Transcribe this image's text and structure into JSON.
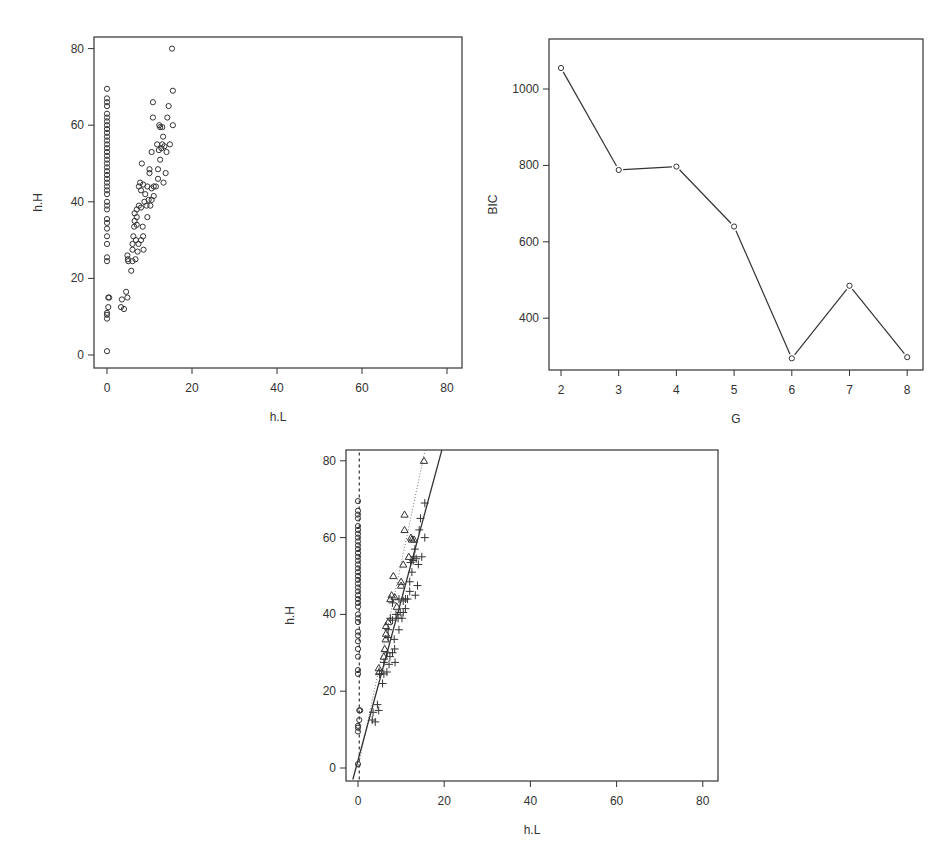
{
  "chart_data": [
    {
      "id": "scatter-raw",
      "type": "scatter",
      "title": "",
      "xlabel": "h.L",
      "ylabel": "h.H",
      "xlim": [
        0,
        80
      ],
      "ylim": [
        0,
        80
      ],
      "xticks": [
        0,
        20,
        40,
        60,
        80
      ],
      "yticks": [
        0,
        20,
        40,
        60,
        80
      ],
      "grid": false,
      "marker": "circle",
      "frame": {
        "left": 94,
        "top": 37,
        "right": 462,
        "bottom": 368
      },
      "map": {
        "x0": 107,
        "xs": 4.25,
        "y0": 355,
        "ys": 3.83
      },
      "points": [
        [
          0,
          1
        ],
        [
          0,
          9.5
        ],
        [
          0,
          10.5
        ],
        [
          0,
          11
        ],
        [
          0.3,
          12.5
        ],
        [
          0.3,
          15
        ],
        [
          0.5,
          15
        ],
        [
          0,
          24.5
        ],
        [
          0,
          25.5
        ],
        [
          0,
          29
        ],
        [
          0,
          31
        ],
        [
          0,
          33
        ],
        [
          0,
          34.5
        ],
        [
          0,
          35.5
        ],
        [
          0,
          38
        ],
        [
          0,
          39
        ],
        [
          0,
          40
        ],
        [
          0,
          42
        ],
        [
          0,
          43
        ],
        [
          0,
          44
        ],
        [
          0,
          45
        ],
        [
          0,
          46
        ],
        [
          0,
          47
        ],
        [
          0,
          48
        ],
        [
          0,
          49
        ],
        [
          0,
          50
        ],
        [
          0,
          51
        ],
        [
          0,
          52
        ],
        [
          0,
          53
        ],
        [
          0,
          54
        ],
        [
          0,
          55
        ],
        [
          0,
          56
        ],
        [
          0,
          57
        ],
        [
          0,
          58
        ],
        [
          0,
          59
        ],
        [
          0,
          60
        ],
        [
          0,
          61
        ],
        [
          0,
          62
        ],
        [
          0,
          63
        ],
        [
          0,
          65
        ],
        [
          0,
          66
        ],
        [
          0,
          67
        ],
        [
          0,
          69.5
        ],
        [
          3.3,
          12.5
        ],
        [
          3.5,
          14.5
        ],
        [
          4,
          12
        ],
        [
          4.5,
          16.5
        ],
        [
          4.8,
          15
        ],
        [
          4.8,
          26
        ],
        [
          4.9,
          25
        ],
        [
          5,
          24.5
        ],
        [
          5.7,
          22
        ],
        [
          6,
          24.5
        ],
        [
          6,
          27.5
        ],
        [
          6,
          29
        ],
        [
          6.2,
          31
        ],
        [
          6.4,
          33.5
        ],
        [
          6.5,
          35
        ],
        [
          6.5,
          37
        ],
        [
          6.7,
          25
        ],
        [
          6.8,
          30
        ],
        [
          7,
          34
        ],
        [
          7,
          36
        ],
        [
          7,
          38
        ],
        [
          7.2,
          27
        ],
        [
          7.4,
          29
        ],
        [
          7.5,
          44
        ],
        [
          7.5,
          39
        ],
        [
          7.8,
          45
        ],
        [
          8,
          30
        ],
        [
          8,
          38.5
        ],
        [
          8,
          43
        ],
        [
          8.2,
          50
        ],
        [
          8.4,
          33.5
        ],
        [
          8.5,
          31
        ],
        [
          8.5,
          44.5
        ],
        [
          8.6,
          27.5
        ],
        [
          8.8,
          40
        ],
        [
          9,
          42
        ],
        [
          9.3,
          39
        ],
        [
          9.5,
          36
        ],
        [
          9.5,
          44
        ],
        [
          9.8,
          40.5
        ],
        [
          10,
          47.5
        ],
        [
          10,
          48.5
        ],
        [
          10.2,
          39
        ],
        [
          10.5,
          53
        ],
        [
          10.5,
          43.5
        ],
        [
          10.5,
          40.5
        ],
        [
          10.8,
          62
        ],
        [
          10.8,
          66
        ],
        [
          11,
          44
        ],
        [
          11,
          41.5
        ],
        [
          11.5,
          44
        ],
        [
          11.8,
          55
        ],
        [
          12,
          48.5
        ],
        [
          12,
          46
        ],
        [
          12.2,
          53.5
        ],
        [
          12.3,
          60
        ],
        [
          12.5,
          59.5
        ],
        [
          12.5,
          51
        ],
        [
          12.8,
          54
        ],
        [
          13,
          59.5
        ],
        [
          13,
          55
        ],
        [
          13.2,
          57
        ],
        [
          13.3,
          45
        ],
        [
          13.5,
          54.5
        ],
        [
          13.8,
          47.5
        ],
        [
          14,
          53
        ],
        [
          14.2,
          62
        ],
        [
          14.5,
          65
        ],
        [
          14.8,
          55
        ],
        [
          15.3,
          80
        ],
        [
          15.5,
          69
        ],
        [
          15.5,
          60
        ]
      ]
    },
    {
      "id": "bic-line",
      "type": "line",
      "title": "",
      "xlabel": "G",
      "ylabel": "BIC",
      "x": [
        2,
        3,
        4,
        5,
        6,
        7,
        8
      ],
      "values": [
        1055,
        788,
        797,
        640,
        295,
        485,
        298
      ],
      "xticks": [
        2,
        3,
        4,
        5,
        6,
        7,
        8
      ],
      "yticks": [
        400,
        600,
        800,
        1000
      ],
      "ylim": [
        280,
        1130
      ],
      "grid": false,
      "marker": "circle",
      "frame": {
        "left": 549,
        "top": 39,
        "right": 923,
        "bottom": 370
      },
      "map": {
        "x0": 561,
        "xs": 57.7,
        "yref": 1000,
        "ypx": 89,
        "ys": 0.382
      }
    },
    {
      "id": "scatter-clustered",
      "type": "scatter",
      "title": "",
      "xlabel": "h.L",
      "ylabel": "h.H",
      "xlim": [
        0,
        80
      ],
      "ylim": [
        0,
        80
      ],
      "xticks": [
        0,
        20,
        40,
        60,
        80
      ],
      "yticks": [
        0,
        20,
        40,
        60,
        80
      ],
      "grid": false,
      "frame": {
        "left": 346,
        "top": 450,
        "right": 718,
        "bottom": 781
      },
      "map": {
        "x0": 358,
        "xs": 4.31,
        "y0": 768,
        "ys": 3.84
      },
      "series": [
        {
          "name": "cluster 1 (circles)",
          "marker": "circle",
          "points": [
            [
              0,
              1
            ],
            [
              0,
              9.5
            ],
            [
              0,
              10.5
            ],
            [
              0,
              11
            ],
            [
              0.3,
              12.5
            ],
            [
              0.3,
              15
            ],
            [
              0.5,
              15
            ],
            [
              0,
              24.5
            ],
            [
              0,
              25.5
            ],
            [
              0,
              29
            ],
            [
              0,
              31
            ],
            [
              0,
              33
            ],
            [
              0,
              34.5
            ],
            [
              0,
              35.5
            ],
            [
              0,
              38
            ],
            [
              0,
              39
            ],
            [
              0,
              40
            ],
            [
              0,
              42
            ],
            [
              0,
              43
            ],
            [
              0,
              44
            ],
            [
              0,
              45
            ],
            [
              0,
              46
            ],
            [
              0,
              47
            ],
            [
              0,
              48
            ],
            [
              0,
              49
            ],
            [
              0,
              50
            ],
            [
              0,
              51
            ],
            [
              0,
              52
            ],
            [
              0,
              53
            ],
            [
              0,
              54
            ],
            [
              0,
              55
            ],
            [
              0,
              56
            ],
            [
              0,
              57
            ],
            [
              0,
              58
            ],
            [
              0,
              59
            ],
            [
              0,
              60
            ],
            [
              0,
              61
            ],
            [
              0,
              62
            ],
            [
              0,
              63
            ],
            [
              0,
              65
            ],
            [
              0,
              66
            ],
            [
              0,
              67
            ],
            [
              0,
              69.5
            ]
          ]
        },
        {
          "name": "cluster 2 (triangles)",
          "marker": "triangle",
          "points": [
            [
              4.8,
              26
            ],
            [
              4.9,
              25
            ],
            [
              6,
              29
            ],
            [
              6.2,
              31
            ],
            [
              6.4,
              33.5
            ],
            [
              6.5,
              35
            ],
            [
              6.5,
              37
            ],
            [
              7,
              38
            ],
            [
              7.5,
              44
            ],
            [
              7.8,
              45
            ],
            [
              8.2,
              50
            ],
            [
              8.5,
              44.5
            ],
            [
              9,
              42
            ],
            [
              10,
              47.5
            ],
            [
              10,
              48.5
            ],
            [
              10.5,
              53
            ],
            [
              10.8,
              62
            ],
            [
              10.8,
              66
            ],
            [
              11.8,
              55
            ],
            [
              12.3,
              60
            ],
            [
              12.5,
              59.5
            ],
            [
              13,
              59.5
            ],
            [
              15.3,
              80
            ]
          ]
        },
        {
          "name": "cluster 3 (crosses)",
          "marker": "cross",
          "points": [
            [
              3.3,
              12.5
            ],
            [
              3.5,
              14.5
            ],
            [
              4,
              12
            ],
            [
              4.5,
              16.5
            ],
            [
              4.8,
              15
            ],
            [
              5,
              24.5
            ],
            [
              5.7,
              22
            ],
            [
              6,
              24.5
            ],
            [
              6,
              27.5
            ],
            [
              6.7,
              25
            ],
            [
              6.8,
              30
            ],
            [
              7,
              34
            ],
            [
              7,
              36
            ],
            [
              7.2,
              27
            ],
            [
              7.4,
              29
            ],
            [
              7.5,
              39
            ],
            [
              8,
              30
            ],
            [
              8,
              38.5
            ],
            [
              8,
              43
            ],
            [
              8.4,
              33.5
            ],
            [
              8.5,
              31
            ],
            [
              8.6,
              27.5
            ],
            [
              8.8,
              40
            ],
            [
              9.3,
              39
            ],
            [
              9.5,
              36
            ],
            [
              9.5,
              44
            ],
            [
              9.8,
              40.5
            ],
            [
              10.2,
              39
            ],
            [
              10.5,
              43.5
            ],
            [
              10.5,
              40.5
            ],
            [
              11,
              44
            ],
            [
              11,
              41.5
            ],
            [
              11.5,
              44
            ],
            [
              12,
              48.5
            ],
            [
              12,
              46
            ],
            [
              12.2,
              53.5
            ],
            [
              12.5,
              51
            ],
            [
              12.8,
              54
            ],
            [
              13,
              55
            ],
            [
              13.2,
              57
            ],
            [
              13.3,
              45
            ],
            [
              13.5,
              54.5
            ],
            [
              13.8,
              47.5
            ],
            [
              14,
              53
            ],
            [
              14.2,
              62
            ],
            [
              14.5,
              65
            ],
            [
              14.8,
              55
            ],
            [
              15.5,
              69
            ],
            [
              15.5,
              60
            ]
          ]
        }
      ],
      "lines": [
        {
          "name": "cluster 1 fit",
          "style": "dashed",
          "x1": 0.3,
          "y1": -3,
          "x2": 0.3,
          "y2": 83
        },
        {
          "name": "cluster 2 fit",
          "style": "dotted",
          "x1": 0,
          "y1": 0,
          "x2": 15.6,
          "y2": 83
        },
        {
          "name": "cluster 3 fit",
          "style": "solid",
          "x1": -1.2,
          "y1": -3,
          "x2": 19.5,
          "y2": 83
        }
      ]
    }
  ]
}
